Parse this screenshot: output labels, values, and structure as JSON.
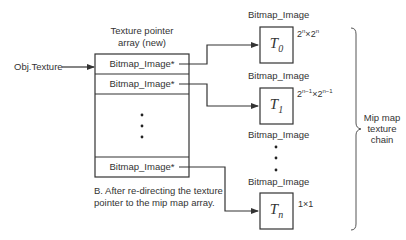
{
  "array": {
    "title_line1": "Texture pointer",
    "title_line2": "array (new)",
    "source_label": "Obj.Texture",
    "rows": [
      {
        "label": "Bitmap_Image*"
      },
      {
        "label": "Bitmap_Image*"
      },
      {
        "label": "Bitmap_Image*"
      }
    ]
  },
  "caption": {
    "line1": "B. After re-directing the texture",
    "line2": "pointer to the mip map array."
  },
  "chain": {
    "levels": [
      {
        "header": "Bitmap_Image",
        "name": "T",
        "sub": "0",
        "size_base": "2",
        "size_exp": "n",
        "size_x": "×",
        "size_base2": "2",
        "size_exp2": "n"
      },
      {
        "header": "Bitmap_Image",
        "name": "T",
        "sub": "1",
        "size_base": "2",
        "size_exp": "n−1",
        "size_x": "×",
        "size_base2": "2",
        "size_exp2": "n−1"
      },
      {
        "header": "Bitmap_Image"
      },
      {
        "header": "Bitmap_Image",
        "name": "T",
        "sub": "n",
        "size": "1×1"
      }
    ],
    "brace_label_line1": "Mip map",
    "brace_label_line2": "texture",
    "brace_label_line3": "chain"
  },
  "colors": {
    "stroke": "#333333",
    "text": "#333333"
  }
}
